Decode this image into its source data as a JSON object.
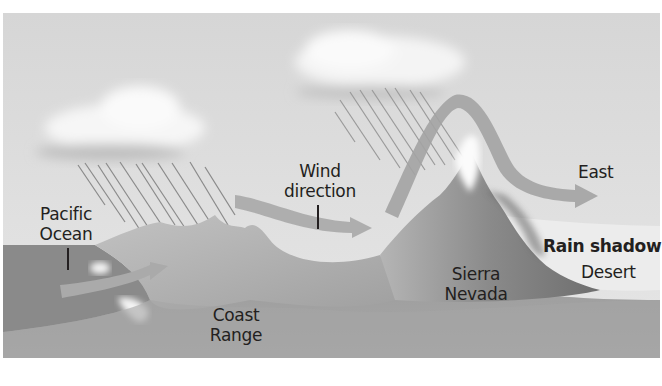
{
  "diagram": {
    "colors": {
      "background": "#ffffff",
      "sky": "#dcdcdc",
      "ocean": "#8d8d8d",
      "land": "#9a9a9a",
      "land_dark": "#7e7e7e",
      "coast_range": "#b4b4b4",
      "sierra": "#8a8a8a",
      "desert": "#e8e8e8",
      "cloud": "#f4f4f4",
      "rain": "#7a7a7a",
      "wind_arrow": "#a9a9a9",
      "text": "#231f20"
    },
    "labels": {
      "pacific_line1": "Pacific",
      "pacific_line2": "Ocean",
      "wind_line1": "Wind",
      "wind_line2": "direction",
      "east": "East",
      "rain_shadow": "Rain shadow",
      "desert": "Desert",
      "sierra_line1": "Sierra",
      "sierra_line2": "Nevada",
      "coast_line1": "Coast",
      "coast_line2": "Range"
    }
  }
}
